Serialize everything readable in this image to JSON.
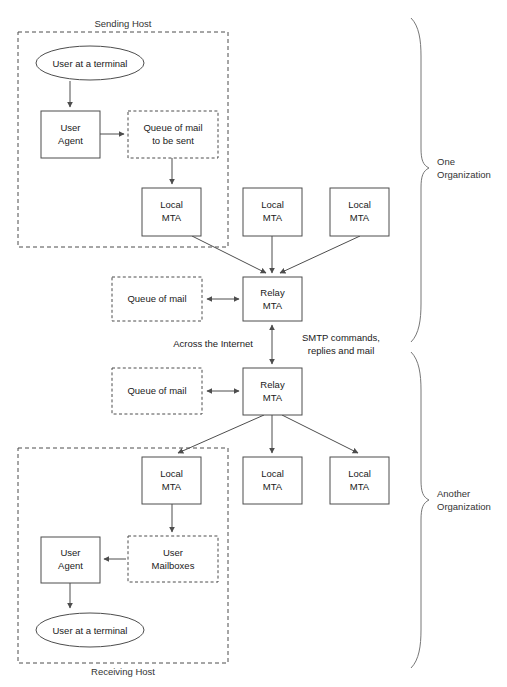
{
  "figure": {
    "caption_faint": "",
    "colors": {
      "stroke": "#4d4d4d",
      "brace_stroke": "#777777",
      "text": "#1a1a1a",
      "background": "#ffffff"
    }
  },
  "groups": {
    "sending_host": {
      "label": "Sending Host"
    },
    "receiving_host": {
      "label": "Receiving Host"
    },
    "one_organization": {
      "label_line1": "One",
      "label_line2": "Organization"
    },
    "another_organization": {
      "label_line1": "Another",
      "label_line2": "Organization"
    }
  },
  "top": {
    "user_terminal": {
      "label": "User at a terminal"
    },
    "user_agent": {
      "line1": "User",
      "line2": "Agent"
    },
    "queue_to_send": {
      "line1": "Queue of mail",
      "line2": "to be sent"
    },
    "local_mta_1": {
      "line1": "Local",
      "line2": "MTA"
    },
    "local_mta_2": {
      "line1": "Local",
      "line2": "MTA"
    },
    "local_mta_3": {
      "line1": "Local",
      "line2": "MTA"
    },
    "queue_of_mail": {
      "label": "Queue of mail"
    },
    "relay_mta": {
      "line1": "Relay",
      "line2": "MTA"
    }
  },
  "middle": {
    "across_internet": {
      "label": "Across the Internet"
    },
    "smtp_link": {
      "line1": "SMTP commands,",
      "line2": "replies and mail"
    }
  },
  "bottom": {
    "relay_mta": {
      "line1": "Relay",
      "line2": "MTA"
    },
    "queue_of_mail": {
      "label": "Queue of mail"
    },
    "local_mta_1": {
      "line1": "Local",
      "line2": "MTA"
    },
    "local_mta_2": {
      "line1": "Local",
      "line2": "MTA"
    },
    "local_mta_3": {
      "line1": "Local",
      "line2": "MTA"
    },
    "user_mailboxes": {
      "line1": "User",
      "line2": "Mailboxes"
    },
    "user_agent": {
      "line1": "User",
      "line2": "Agent"
    },
    "user_terminal": {
      "label": "User at a terminal"
    }
  }
}
